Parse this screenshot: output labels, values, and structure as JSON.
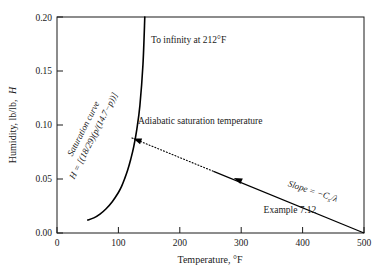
{
  "chart_data": {
    "type": "line",
    "title": "",
    "xlabel": "Temperature, °F",
    "ylabel": "Humidity, lb/lb, H",
    "xlim": [
      0,
      500
    ],
    "ylim": [
      0.0,
      0.2
    ],
    "grid": false,
    "legend": "none",
    "xticks": [
      0,
      100,
      200,
      300,
      400,
      500
    ],
    "xtick_labels": [
      "0",
      "100",
      "200",
      "300",
      "400",
      "500"
    ],
    "yticks": [
      0.0,
      0.05,
      0.1,
      0.15,
      0.2
    ],
    "ytick_labels": [
      "0.00",
      "0.05",
      "0.10",
      "0.15",
      "0.20"
    ],
    "series": [
      {
        "name": "Saturation curve",
        "style": "solid",
        "x": [
          50,
          60,
          70,
          80,
          90,
          100,
          105,
          110,
          115,
          120,
          125,
          130,
          135,
          140,
          143
        ],
        "y": [
          0.012,
          0.014,
          0.0175,
          0.0225,
          0.029,
          0.0375,
          0.043,
          0.05,
          0.058,
          0.068,
          0.08,
          0.096,
          0.118,
          0.156,
          0.2
        ]
      },
      {
        "name": "Adiabatic saturation line",
        "style": "dotted-then-solid",
        "x": [
          122,
          300,
          500
        ],
        "y": [
          0.088,
          0.0505,
          0.0
        ],
        "solid_from_x": 255
      }
    ],
    "annotations": [
      {
        "name": "to-infinity",
        "text": "To infinity at 212°F",
        "x": 148,
        "y": 0.187
      },
      {
        "name": "adiabatic-saturation-temperature",
        "text": "Adiabatic saturation temperature",
        "x": 140,
        "y": 0.092
      },
      {
        "name": "saturation-curve-label",
        "text": "Saturation curve",
        "x": 85,
        "y": 0.105,
        "rotation": -63
      },
      {
        "name": "saturation-curve-equation",
        "text": "H = [(18/29)(p/(14.7−p))]",
        "x": 95,
        "y": 0.099,
        "rotation": -63
      },
      {
        "name": "slope-label",
        "text": "Slope = −C",
        "subscript": "s",
        "tail": "/λ",
        "x": 390,
        "y": 0.033,
        "rotation": 18
      },
      {
        "name": "example-label",
        "text": "Example 7.12",
        "x": 330,
        "y": 0.014
      }
    ],
    "arrows": [
      {
        "name": "arrow-to-saturation-curve",
        "from_x": 160,
        "from_y": 0.08,
        "to_x": 124,
        "to_y": 0.0875
      },
      {
        "name": "arrow-along-adiabatic-line",
        "from_x": 340,
        "from_y": 0.038,
        "to_x": 288,
        "to_y": 0.051
      }
    ]
  },
  "axes": {
    "x_axis_title": "Temperature, °F",
    "y_axis_title": "Humidity, lb/lb, H",
    "y_axis_title_main": "Humidity, lb/lb,",
    "y_axis_title_symbol": "H"
  },
  "colors": {
    "line": "#000000",
    "axis": "#1a1a1a",
    "background": "#ffffff",
    "text": "#1a1a1a"
  },
  "labels": {
    "x0": "0",
    "x100": "100",
    "x200": "200",
    "x300": "300",
    "x400": "400",
    "x500": "500",
    "y000": "0.00",
    "y005": "0.05",
    "y010": "0.10",
    "y015": "0.15",
    "y020": "0.20",
    "to_infinity": "To infinity at 212°F",
    "adiabatic": "Adiabatic saturation temperature",
    "sat_curve": "Saturation curve",
    "sat_eq": "H = [(18/29)(p/(14.7−p))]",
    "slope_prefix": "Slope = −C",
    "slope_sub": "s",
    "slope_suffix": "/λ",
    "example": "Example 7.12"
  }
}
